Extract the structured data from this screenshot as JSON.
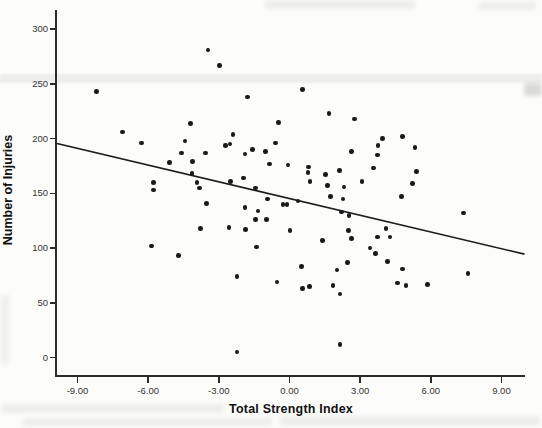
{
  "page": {
    "background": "#fcfcfb"
  },
  "chart_data": {
    "type": "scatter",
    "title": "",
    "xlabel": "Total Strength Index",
    "ylabel": "Number of Injuries",
    "grid": false,
    "legend": null,
    "xlim": [
      -9.87,
      10.0
    ],
    "ylim": [
      -16.8,
      317.5
    ],
    "x_ticks": [
      {
        "value": -9,
        "label": "-9.00"
      },
      {
        "value": -6,
        "label": "-6.00"
      },
      {
        "value": -3,
        "label": "-3.00"
      },
      {
        "value": 0,
        "label": "0.00"
      },
      {
        "value": 3,
        "label": "3.00"
      },
      {
        "value": 6,
        "label": "6.00"
      },
      {
        "value": 9,
        "label": "9.00"
      }
    ],
    "y_ticks": [
      {
        "value": 0,
        "label": "0"
      },
      {
        "value": 50,
        "label": "50"
      },
      {
        "value": 100,
        "label": "100"
      },
      {
        "value": 150,
        "label": "150"
      },
      {
        "value": 200,
        "label": "200"
      },
      {
        "value": 250,
        "label": "250"
      },
      {
        "value": 300,
        "label": "300"
      }
    ],
    "points": [
      [
        -3.46,
        281
      ],
      [
        -8.2,
        243
      ],
      [
        -4.2,
        214
      ],
      [
        -2.98,
        267
      ],
      [
        -1.78,
        238
      ],
      [
        0.55,
        245
      ],
      [
        1.67,
        223
      ],
      [
        -0.47,
        215
      ],
      [
        2.77,
        218
      ],
      [
        -7.08,
        206
      ],
      [
        -6.28,
        196
      ],
      [
        -4.44,
        198
      ],
      [
        -4.59,
        187
      ],
      [
        -3.56,
        187
      ],
      [
        -4.11,
        179
      ],
      [
        -5.09,
        178
      ],
      [
        -4.14,
        168
      ],
      [
        -5.77,
        160
      ],
      [
        -5.77,
        153
      ],
      [
        -3.92,
        160
      ],
      [
        -3.82,
        155
      ],
      [
        -3.52,
        141
      ],
      [
        -3.78,
        118
      ],
      [
        -5.85,
        102
      ],
      [
        -2.39,
        204
      ],
      [
        -2.71,
        194
      ],
      [
        -2.53,
        195
      ],
      [
        -1.58,
        190
      ],
      [
        -0.59,
        196
      ],
      [
        -1.88,
        186
      ],
      [
        -1.02,
        188
      ],
      [
        -0.85,
        177
      ],
      [
        -0.06,
        176
      ],
      [
        0.82,
        174
      ],
      [
        0.78,
        169
      ],
      [
        1.53,
        167
      ],
      [
        2.63,
        188
      ],
      [
        2.12,
        171
      ],
      [
        -2.5,
        161
      ],
      [
        -1.96,
        164
      ],
      [
        -1.43,
        155
      ],
      [
        0.87,
        161
      ],
      [
        1.61,
        157
      ],
      [
        2.31,
        156
      ],
      [
        3.08,
        161
      ],
      [
        -0.94,
        145
      ],
      [
        -0.27,
        140
      ],
      [
        -0.1,
        140
      ],
      [
        0.36,
        143
      ],
      [
        -1.88,
        137
      ],
      [
        -1.33,
        134
      ],
      [
        1.74,
        147
      ],
      [
        2.28,
        145
      ],
      [
        2.21,
        133
      ],
      [
        2.53,
        130
      ],
      [
        -1.43,
        126
      ],
      [
        -0.98,
        126
      ],
      [
        -2.56,
        119
      ],
      [
        -1.87,
        117
      ],
      [
        0.02,
        116
      ],
      [
        2.5,
        116
      ],
      [
        2.63,
        109
      ],
      [
        1.4,
        107
      ],
      [
        -1.4,
        101
      ],
      [
        3.95,
        200
      ],
      [
        4.79,
        202
      ],
      [
        3.76,
        194
      ],
      [
        5.33,
        192
      ],
      [
        3.73,
        185
      ],
      [
        3.58,
        173
      ],
      [
        5.4,
        170
      ],
      [
        5.22,
        159
      ],
      [
        4.75,
        147
      ],
      [
        7.38,
        132
      ],
      [
        4.1,
        118
      ],
      [
        3.73,
        110
      ],
      [
        4.26,
        110
      ],
      [
        3.42,
        100
      ],
      [
        3.66,
        95
      ],
      [
        -4.71,
        93
      ],
      [
        -2.22,
        74
      ],
      [
        -0.53,
        69
      ],
      [
        0.51,
        83
      ],
      [
        0.55,
        63
      ],
      [
        0.86,
        65
      ],
      [
        2.02,
        80
      ],
      [
        1.84,
        66
      ],
      [
        2.46,
        87
      ],
      [
        2.15,
        58
      ],
      [
        2.14,
        12
      ],
      [
        -2.22,
        5
      ],
      [
        4.16,
        88
      ],
      [
        4.79,
        81
      ],
      [
        7.58,
        77
      ],
      [
        4.58,
        68
      ],
      [
        4.94,
        66
      ],
      [
        5.85,
        67
      ]
    ],
    "fit_line": {
      "x1": -9.87,
      "y1": 195.5,
      "x2": 9.98,
      "y2": 94.5,
      "slope": -5.09,
      "intercept": 145.4
    },
    "colors": {
      "point": "#191919",
      "line": "#1b1b1b",
      "axis": "#2b2b2b",
      "tick_label": "#333333",
      "axis_label": "#111111"
    }
  }
}
